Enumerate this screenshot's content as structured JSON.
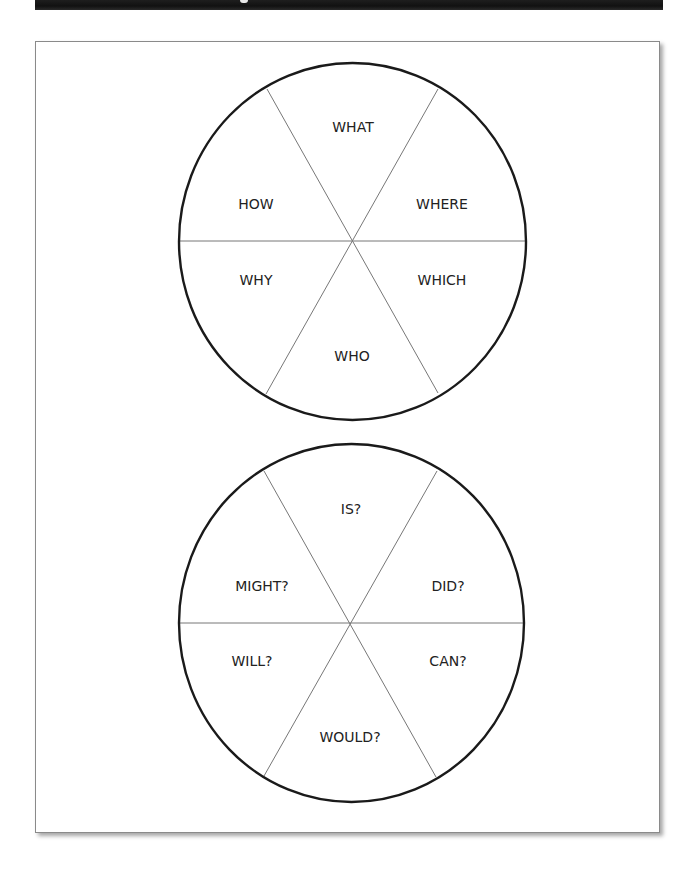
{
  "header": {
    "background_color": "#151515",
    "title_visible_fragment": ""
  },
  "worksheet": {
    "frame_border_color": "#8a8a8a",
    "wheels": [
      {
        "name": "question-words-wheel",
        "segments": {
          "top": "WHAT",
          "upper_left": "HOW",
          "upper_right": "WHERE",
          "lower_left": "WHY",
          "lower_right": "WHICH",
          "bottom": "WHO"
        }
      },
      {
        "name": "question-verbs-wheel",
        "segments": {
          "top": "IS?",
          "upper_left": "MIGHT?",
          "upper_right": "DID?",
          "lower_left": "WILL?",
          "lower_right": "CAN?",
          "bottom": "WOULD?"
        }
      }
    ]
  }
}
